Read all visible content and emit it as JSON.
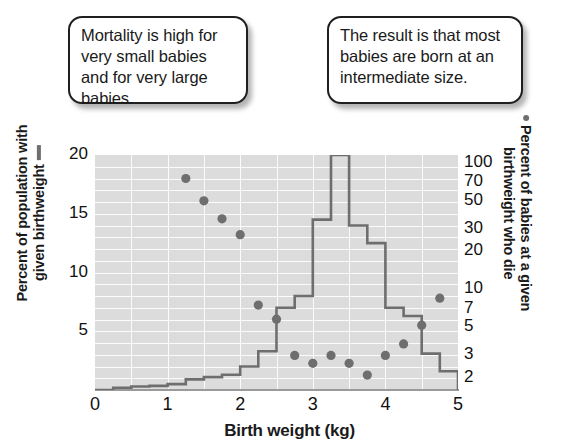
{
  "callouts": [
    {
      "id": "left",
      "text": "Mortality is high for very small babies and for very large babies."
    },
    {
      "id": "right",
      "text": "The result is that most babies are born at an intermediate size."
    }
  ],
  "axes": {
    "x_title": "Birth weight (kg)",
    "y_left_title_line1": "Percent of population with",
    "y_left_title_line2": "given birthweight",
    "y_right_title_line1": "Percent of babies at a given",
    "y_right_title_line2": "birthweight who die",
    "x_ticks": [
      "0",
      "1",
      "2",
      "3",
      "4",
      "5"
    ],
    "y_left_ticks": [
      "20",
      "15",
      "10",
      "5"
    ],
    "y_right_ticks": [
      "100",
      "70",
      "50",
      "30",
      "20",
      "10",
      "7",
      "5",
      "3",
      "2"
    ]
  },
  "colors": {
    "plot_background": "#dcdcdc",
    "gridline": "#fbfbfb",
    "series": "#6e6e6e",
    "text": "#111111",
    "callout_border": "#1f1f1f"
  },
  "chart_data": {
    "type": "line",
    "title": "",
    "subtitle": "",
    "xlabel": "Birth weight (kg)",
    "ylabel": "Percent of population with given birthweight",
    "y2label": "Percent of babies at a given birthweight who die",
    "xlim": [
      0,
      5
    ],
    "ylim": [
      0,
      20
    ],
    "y2lim": [
      1.6,
      115
    ],
    "y2_scale": "log",
    "grid": true,
    "legend": "none",
    "series": [
      {
        "name": "Percent of population with given birthweight",
        "type": "step-histogram",
        "axis": "left",
        "bin_width": 0.25,
        "bin_starts": [
          0.0,
          0.25,
          0.5,
          0.75,
          1.0,
          1.25,
          1.5,
          1.75,
          2.0,
          2.25,
          2.5,
          2.75,
          3.0,
          3.25,
          3.5,
          3.75,
          4.0,
          4.25,
          4.5,
          4.75
        ],
        "values": [
          0.0,
          0.2,
          0.3,
          0.35,
          0.5,
          0.9,
          1.1,
          1.3,
          2.0,
          3.3,
          7.0,
          8.0,
          14.5,
          20.0,
          14.0,
          12.5,
          7.0,
          6.3,
          3.1,
          1.6
        ]
      },
      {
        "name": "Percent of babies at a given birthweight who die",
        "type": "scatter",
        "axis": "right",
        "x": [
          1.25,
          1.5,
          1.75,
          2.0,
          2.25,
          2.5,
          2.75,
          3.0,
          3.25,
          3.5,
          3.75,
          4.0,
          4.25,
          4.5,
          4.75
        ],
        "y": [
          75,
          50,
          36,
          27,
          7.5,
          5.8,
          3.0,
          2.6,
          3.0,
          2.6,
          2.1,
          3.0,
          3.7,
          5.2,
          8.5
        ]
      }
    ]
  }
}
